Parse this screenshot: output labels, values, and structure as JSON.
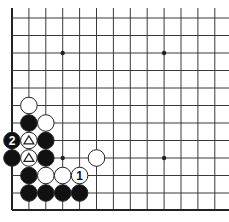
{
  "diagram": {
    "type": "go-board-fragment",
    "colors": {
      "background": "#ffffff",
      "line": "#3a3a3a",
      "edge": "#222222",
      "black_stone": "#111111",
      "white_stone": "#ffffff",
      "stone_outline": "#222222"
    },
    "grid": {
      "x_lines": [
        12,
        28.9,
        45.8,
        62.7,
        79.6,
        96.5,
        113.4,
        130.3,
        147.2,
        164.1,
        181,
        197.9,
        214.8
      ],
      "y_lines": [
        18,
        35.5,
        53,
        70.5,
        88,
        105.5,
        123,
        140.5,
        158,
        175.5,
        193,
        210
      ],
      "left_edge": true,
      "bottom_edge": true
    },
    "star_points": [
      {
        "col": 3,
        "row": 2
      },
      {
        "col": 9,
        "row": 2
      },
      {
        "col": 3,
        "row": 8
      },
      {
        "col": 9,
        "row": 8
      }
    ],
    "stones": [
      {
        "color": "white",
        "col": 1,
        "row": 5,
        "label": ""
      },
      {
        "color": "black",
        "col": 1,
        "row": 6,
        "label": ""
      },
      {
        "color": "white",
        "col": 2,
        "row": 6,
        "label": ""
      },
      {
        "color": "black",
        "col": 0,
        "row": 7,
        "label": "2"
      },
      {
        "color": "white",
        "col": 1,
        "row": 7,
        "label": "",
        "marker": "triangle"
      },
      {
        "color": "black",
        "col": 2,
        "row": 7,
        "label": ""
      },
      {
        "color": "black",
        "col": 0,
        "row": 8,
        "label": ""
      },
      {
        "color": "white",
        "col": 1,
        "row": 8,
        "label": "",
        "marker": "triangle"
      },
      {
        "color": "black",
        "col": 2,
        "row": 8,
        "label": ""
      },
      {
        "color": "white",
        "col": 5,
        "row": 8,
        "label": ""
      },
      {
        "color": "black",
        "col": 1,
        "row": 9,
        "label": ""
      },
      {
        "color": "white",
        "col": 2,
        "row": 9,
        "label": ""
      },
      {
        "color": "white",
        "col": 3,
        "row": 9,
        "label": ""
      },
      {
        "color": "white",
        "col": 4,
        "row": 9,
        "label": "1"
      },
      {
        "color": "black",
        "col": 1,
        "row": 10,
        "label": ""
      },
      {
        "color": "black",
        "col": 2,
        "row": 10,
        "label": ""
      },
      {
        "color": "black",
        "col": 3,
        "row": 10,
        "label": ""
      },
      {
        "color": "black",
        "col": 4,
        "row": 10,
        "label": ""
      }
    ],
    "move_labels": [
      "1",
      "2"
    ]
  }
}
